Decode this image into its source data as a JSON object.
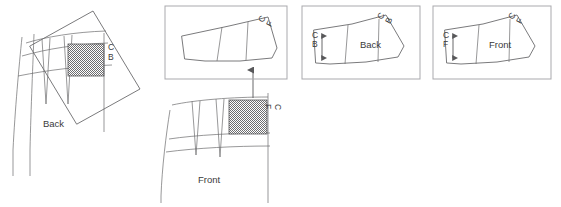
{
  "figure": {
    "title": "",
    "background_color": "#ffffff",
    "line_color": "#58585a",
    "frame_color": "#a9a9ad",
    "shade_color": "#8e8e90",
    "text_color": "#3a3a3a"
  },
  "panels": [
    {
      "id": "panel-back-source",
      "has_frame": false,
      "labels": {
        "piece": "Back",
        "center_line_top": "C",
        "center_line_bottom": "B"
      },
      "shaded_block_label": "C B",
      "description_labels": [
        "Back",
        "C",
        "B"
      ]
    },
    {
      "id": "panel-front-source",
      "has_frame": false,
      "labels": {
        "piece": "Front",
        "center_line_top": "C",
        "center_line_bottom": "F"
      },
      "shaded_block_label": "C F",
      "description_labels": [
        "Front",
        "C",
        "F"
      ]
    },
    {
      "id": "panel-front-flat",
      "has_frame": true,
      "labels": {
        "corner_top": "C",
        "corner_bottom": "F"
      },
      "description_labels": [
        "C",
        "F"
      ]
    },
    {
      "id": "panel-back-final",
      "has_frame": true,
      "labels": {
        "piece": "Back",
        "grain_top": "C",
        "grain_bottom": "B",
        "corner_top": "C",
        "corner_bottom": "B"
      },
      "description_labels": [
        "C",
        "B",
        "Back"
      ]
    },
    {
      "id": "panel-front-final",
      "has_frame": true,
      "labels": {
        "piece": "Front",
        "grain_top": "C",
        "grain_bottom": "F",
        "corner_top": "C",
        "corner_bottom": "F"
      },
      "description_labels": [
        "C",
        "F",
        "Front"
      ]
    }
  ],
  "connector": {
    "name": "upward-arrow",
    "direction": "up",
    "from_panel": "panel-front-source",
    "to_panel": "panel-front-flat"
  },
  "grain_arrows": [
    {
      "panel": "panel-back-final",
      "type": "double-headed-vertical"
    },
    {
      "panel": "panel-front-final",
      "type": "double-headed-vertical"
    }
  ]
}
